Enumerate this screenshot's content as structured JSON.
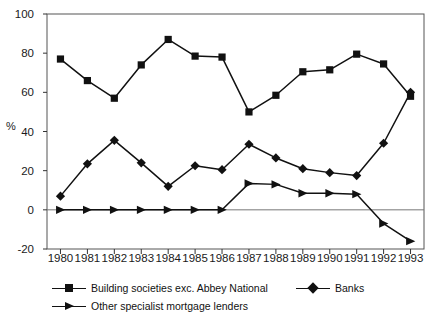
{
  "chart_data": {
    "type": "line",
    "title": "",
    "xlabel": "",
    "ylabel": "%",
    "categories": [
      "1980",
      "1981",
      "1982",
      "1983",
      "1984",
      "1985",
      "1986",
      "1987",
      "1988",
      "1989",
      "1990",
      "1991",
      "1992",
      "1993"
    ],
    "ylim": [
      -20,
      100
    ],
    "yticks": [
      -20,
      0,
      20,
      40,
      60,
      80,
      100
    ],
    "grid": false,
    "zero_line": true,
    "legend_position": "bottom",
    "series": [
      {
        "name": "Building societies exc. Abbey National",
        "marker": "square",
        "color": "#111111",
        "values": [
          77,
          66,
          57,
          74,
          87,
          78.5,
          78,
          50,
          58.5,
          70.5,
          71.5,
          79.5,
          74.5,
          58
        ]
      },
      {
        "name": "Banks",
        "marker": "diamond",
        "color": "#111111",
        "values": [
          7,
          23.5,
          35.5,
          24,
          12,
          22.5,
          20.5,
          33.5,
          26.5,
          21,
          19,
          17.5,
          34,
          60
        ]
      },
      {
        "name": "Other specialist mortgage lenders",
        "marker": "triangle",
        "color": "#111111",
        "values": [
          0,
          0,
          0,
          0,
          0,
          0,
          0,
          13.5,
          13,
          8.5,
          8.5,
          8,
          -7,
          -16
        ]
      }
    ]
  },
  "axis": {
    "y_label": "%",
    "y_tick_labels": [
      "100",
      "80",
      "60",
      "40",
      "20",
      "0",
      "-20"
    ],
    "x_tick_labels": [
      "1980",
      "1981",
      "1982",
      "1983",
      "1984",
      "1985",
      "1986",
      "1987",
      "1988",
      "1989",
      "1990",
      "1991",
      "1992",
      "1993"
    ]
  },
  "legend": {
    "items": [
      {
        "label": "Building societies exc. Abbey National",
        "marker": "square"
      },
      {
        "label": "Banks",
        "marker": "diamond"
      },
      {
        "label": "Other specialist mortgage lenders",
        "marker": "triangle"
      }
    ]
  }
}
